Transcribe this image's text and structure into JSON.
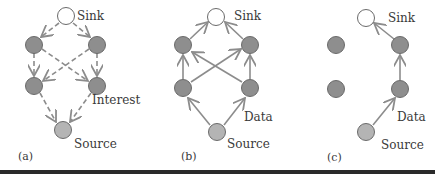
{
  "colors": {
    "sink_fill": "#ffffff",
    "relay_fill": "#8e8e8e",
    "source_fill": "#b4b4b4",
    "node_stroke": "#6a6a6a",
    "edge": "#8c8c8c",
    "bottom_rule": "#2a2a2a"
  },
  "panels": [
    {
      "caption": "(a)",
      "sink_label": "Sink",
      "source_label": "Source",
      "edge_label": "Interest",
      "edge_style": "dashed",
      "direction": "sink-to-source"
    },
    {
      "caption": "(b)",
      "sink_label": "Sink",
      "source_label": "Source",
      "edge_label": "Data",
      "edge_style": "solid",
      "direction": "source-to-sink"
    },
    {
      "caption": "(c)",
      "sink_label": "Sink",
      "source_label": "Source",
      "edge_label": "Data",
      "edge_style": "solid",
      "direction": "source-to-sink-single-path"
    }
  ]
}
